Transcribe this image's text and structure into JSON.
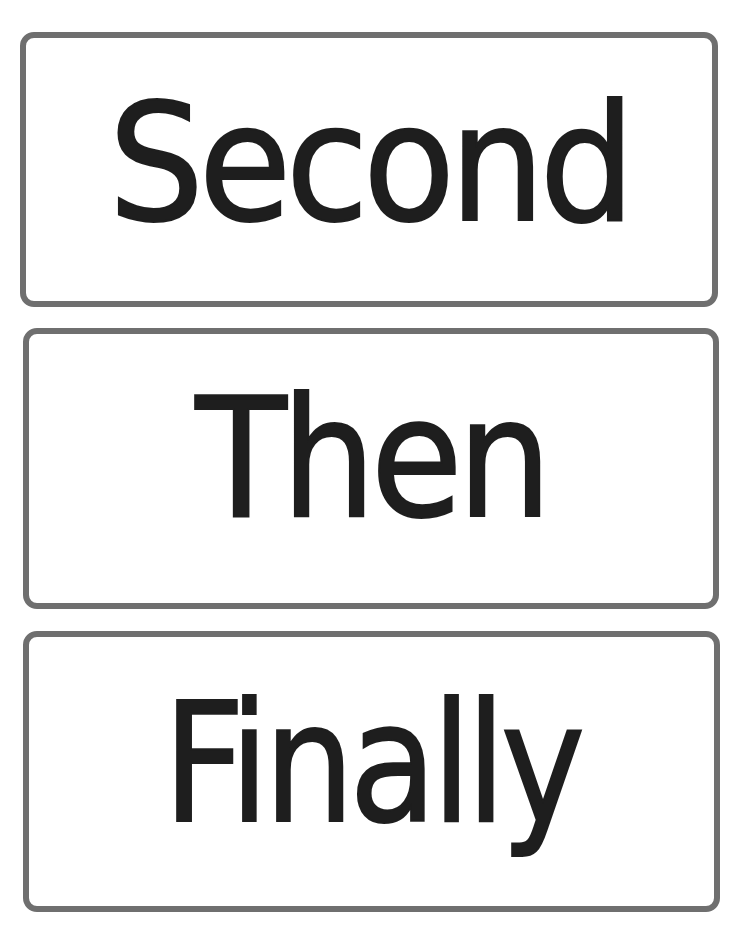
{
  "cards": [
    {
      "word": "Second"
    },
    {
      "word": "Then"
    },
    {
      "word": "Finally"
    }
  ],
  "colors": {
    "border": "#6f6f6f",
    "text": "#1e1e1e",
    "background": "#ffffff"
  }
}
